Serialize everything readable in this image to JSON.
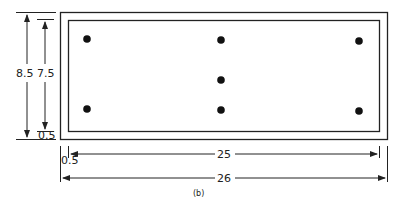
{
  "diagram": {
    "caption": "(b)",
    "plate": {
      "outer_width": "26",
      "inner_width": "25",
      "outer_height": "8.5",
      "inner_height": "7.5",
      "edge_offset_bottom": "0.5",
      "edge_offset_left": "0.5"
    },
    "bolts": [
      {
        "col": "left",
        "row": "top"
      },
      {
        "col": "center",
        "row": "top"
      },
      {
        "col": "right",
        "row": "top"
      },
      {
        "col": "center",
        "row": "middle"
      },
      {
        "col": "left",
        "row": "bottom"
      },
      {
        "col": "center",
        "row": "bottom"
      },
      {
        "col": "right",
        "row": "bottom"
      }
    ],
    "colors": {
      "line": "#222222",
      "background": "#ffffff"
    }
  }
}
